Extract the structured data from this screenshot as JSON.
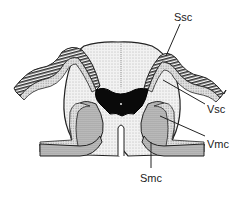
{
  "figure": {
    "labels": {
      "ssc": "Ssc",
      "vsc": "Vsc",
      "vmc": "Vmc",
      "smc": "Smc"
    }
  }
}
